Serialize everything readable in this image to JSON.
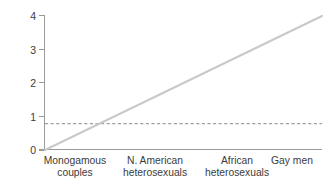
{
  "chart_data": {
    "type": "line",
    "title": "",
    "xlabel": "",
    "ylabel": "Reproductive rate",
    "categories": [
      "Monogamous couples",
      "N. American heterosexuals",
      "African heterosexuals",
      "Gay men"
    ],
    "category_lines": [
      [
        "Monogamous",
        "couples"
      ],
      [
        "N. American",
        "heterosexuals"
      ],
      [
        "African",
        "heterosexuals"
      ],
      [
        "Gay men"
      ]
    ],
    "ylim": [
      0,
      4
    ],
    "xlim": [
      0,
      3
    ],
    "yticks": [
      0,
      1,
      2,
      3,
      4
    ],
    "ytick_labels": [
      "0",
      "1",
      "2",
      "3",
      "4"
    ],
    "xticks": [],
    "grid": false,
    "legend": null,
    "series": [
      {
        "name": "reproductive-rate-trend",
        "style": "solid",
        "color": "#c9c9c9",
        "x": [
          0,
          3
        ],
        "values": [
          0,
          4
        ]
      },
      {
        "name": "threshold-line",
        "style": "dashed",
        "color": "#a0a0a0",
        "x": [
          0,
          3
        ],
        "values": [
          0.79,
          0.79
        ]
      }
    ],
    "annotations": [],
    "colors": {
      "trend_line": "#c9c9c9",
      "threshold_line": "#a0a0a0",
      "axis": "#9a9a9a",
      "text": "#3b3b3b",
      "background": "#ffffff"
    }
  }
}
